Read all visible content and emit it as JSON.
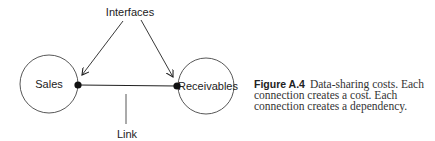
{
  "diagram": {
    "nodes": [
      {
        "id": "sales",
        "label": "Sales"
      },
      {
        "id": "receivables",
        "label": "Receivables"
      }
    ],
    "edges": [
      {
        "from": "sales",
        "to": "receivables",
        "label": "Link"
      }
    ],
    "annotations": {
      "interfaces": "Interfaces",
      "link": "Link"
    }
  },
  "caption": {
    "figure_label": "Figure A.4",
    "text": "Data-sharing costs. Each connection creates a cost. Each connection creates a dependency."
  }
}
